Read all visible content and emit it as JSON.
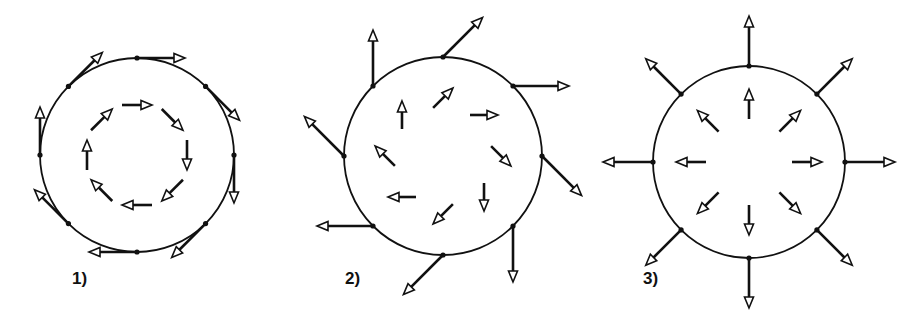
{
  "figure": {
    "stroke_color": "#111111",
    "background": "#ffffff",
    "panels": [
      {
        "label": "1)",
        "kind": "tangential-clockwise",
        "cx": 137,
        "cy": 155,
        "r": 97,
        "outer_angle_offset_deg": 0,
        "outer_len": 48,
        "inner_r": 50,
        "inner_len": 30,
        "label_x": 72,
        "label_y": 283
      },
      {
        "label": "2)",
        "kind": "inclined-45",
        "cx": 443,
        "cy": 156,
        "r": 99,
        "outer_angle_offset_deg": 45,
        "outer_len": 56,
        "inner_r": 58,
        "inner_len": 28,
        "label_x": 345,
        "label_y": 283
      },
      {
        "label": "3)",
        "kind": "radial-outward",
        "cx": 749,
        "cy": 162,
        "r": 96,
        "outer_angle_offset_deg": 90,
        "outer_len": 50,
        "inner_r": 58,
        "inner_len": 30,
        "label_x": 643,
        "label_y": 283
      }
    ]
  }
}
